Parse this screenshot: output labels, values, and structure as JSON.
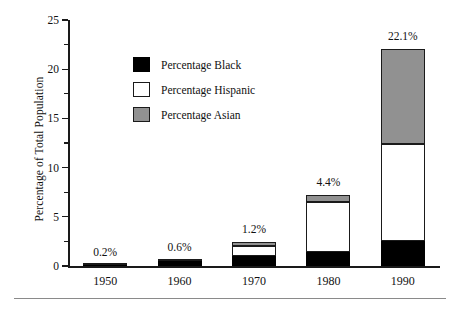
{
  "chart_data": {
    "type": "bar",
    "subtype": "stacked-bar",
    "title": "",
    "xlabel": "",
    "ylabel": "Percentage of Total Population",
    "categories": [
      "1950",
      "1960",
      "1970",
      "1980",
      "1990"
    ],
    "series": [
      {
        "name": "Percentage Black",
        "color": "#000000",
        "values": [
          0.1,
          0.55,
          1.0,
          1.4,
          2.5
        ]
      },
      {
        "name": "Percentage Hispanic",
        "color": "#ffffff",
        "values": [
          0.05,
          0.05,
          1.0,
          5.1,
          9.9
        ]
      },
      {
        "name": "Percentage Asian",
        "color": "#919191",
        "values": [
          0.0,
          0.0,
          0.4,
          0.7,
          9.7
        ]
      }
    ],
    "bar_totals": [
      0.15,
      0.6,
      2.4,
      7.2,
      22.1
    ],
    "data_labels": [
      "0.2%",
      "0.6%",
      "1.2%",
      "4.4%",
      "22.1%"
    ],
    "ylim": [
      0,
      25
    ],
    "y_major_ticks": [
      0,
      5,
      10,
      15,
      20,
      25
    ],
    "y_tick_labels": [
      "0",
      "5",
      "10",
      "15",
      "20",
      "25"
    ],
    "y_minor_ticks": [
      2.5,
      7.5,
      12.5,
      17.5,
      22.5
    ],
    "grid": false,
    "legend_position": "upper-left-inside"
  },
  "legend": {
    "items": [
      {
        "label": "Percentage Black",
        "swatch": "black-swatch"
      },
      {
        "label": "Percentage Hispanic",
        "swatch": "white-swatch"
      },
      {
        "label": "Percentage Asian",
        "swatch": "gray-swatch"
      }
    ]
  }
}
